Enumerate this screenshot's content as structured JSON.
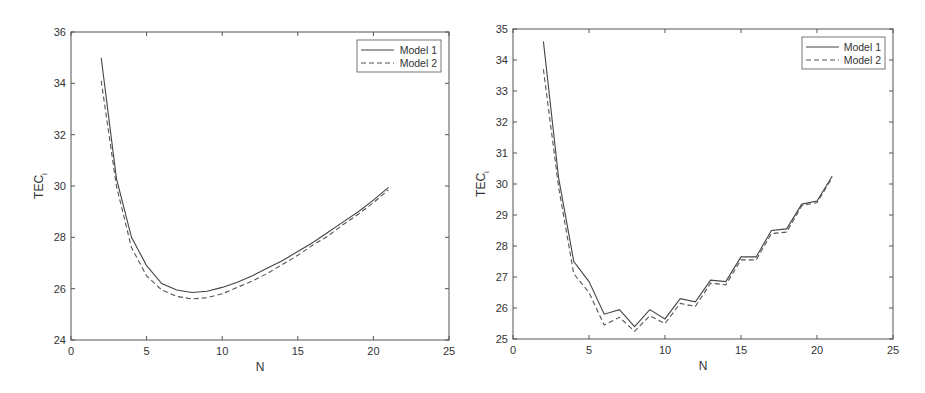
{
  "chart_data": [
    {
      "type": "line",
      "title": "",
      "xlabel": "N",
      "ylabel": "TEC_i",
      "ylabel_main": "TEC",
      "ylabel_sub": "i",
      "xlim": [
        0,
        25
      ],
      "ylim": [
        24,
        36
      ],
      "xticks": [
        0,
        5,
        10,
        15,
        20,
        25
      ],
      "yticks": [
        24,
        26,
        28,
        30,
        32,
        34,
        36
      ],
      "grid": false,
      "legend_position": "upper right",
      "x": [
        2,
        3,
        4,
        5,
        6,
        7,
        8,
        9,
        10,
        11,
        12,
        13,
        14,
        15,
        16,
        17,
        18,
        19,
        20,
        21
      ],
      "series": [
        {
          "name": "Model 1",
          "style": "solid",
          "values": [
            35.0,
            30.3,
            28.0,
            26.9,
            26.2,
            25.95,
            25.85,
            25.9,
            26.05,
            26.25,
            26.5,
            26.8,
            27.1,
            27.45,
            27.8,
            28.2,
            28.6,
            29.0,
            29.45,
            29.95
          ]
        },
        {
          "name": "Model 2",
          "style": "dashed",
          "values": [
            34.1,
            30.0,
            27.6,
            26.5,
            25.95,
            25.7,
            25.6,
            25.65,
            25.8,
            26.05,
            26.3,
            26.6,
            26.95,
            27.3,
            27.7,
            28.05,
            28.5,
            28.9,
            29.35,
            29.85
          ]
        }
      ]
    },
    {
      "type": "line",
      "title": "",
      "xlabel": "N",
      "ylabel": "TEC_i",
      "ylabel_main": "TEC",
      "ylabel_sub": "i",
      "xlim": [
        0,
        25
      ],
      "ylim": [
        25,
        35
      ],
      "xticks": [
        0,
        5,
        10,
        15,
        20,
        25
      ],
      "yticks": [
        25,
        26,
        27,
        28,
        29,
        30,
        31,
        32,
        33,
        34,
        35
      ],
      "grid": false,
      "legend_position": "upper right",
      "x": [
        2,
        3,
        4,
        5,
        6,
        7,
        8,
        9,
        10,
        11,
        12,
        13,
        14,
        15,
        16,
        17,
        18,
        19,
        20,
        21
      ],
      "series": [
        {
          "name": "Model 1",
          "style": "solid",
          "values": [
            34.6,
            30.2,
            27.5,
            26.85,
            25.8,
            25.95,
            25.4,
            25.95,
            25.65,
            26.3,
            26.2,
            26.9,
            26.85,
            27.65,
            27.65,
            28.5,
            28.55,
            29.35,
            29.45,
            30.25
          ]
        },
        {
          "name": "Model 2",
          "style": "dashed",
          "values": [
            33.7,
            29.9,
            27.1,
            26.5,
            25.45,
            25.7,
            25.25,
            25.75,
            25.5,
            26.15,
            26.05,
            26.8,
            26.75,
            27.55,
            27.55,
            28.4,
            28.45,
            29.3,
            29.4,
            30.2
          ]
        }
      ]
    }
  ],
  "layout": [
    {
      "plot": {
        "left": 71,
        "top": 32,
        "right": 449,
        "bottom": 340
      },
      "legend": {
        "left": 357,
        "top": 40,
        "right": 441,
        "bottom": 72
      }
    },
    {
      "plot": {
        "left": 513,
        "top": 29,
        "right": 893,
        "bottom": 339
      },
      "legend": {
        "left": 802,
        "top": 37,
        "right": 885,
        "bottom": 69
      }
    }
  ],
  "colors": {
    "axis": "#555555",
    "series1": "#444444",
    "series2": "#555555",
    "text": "#333333"
  }
}
